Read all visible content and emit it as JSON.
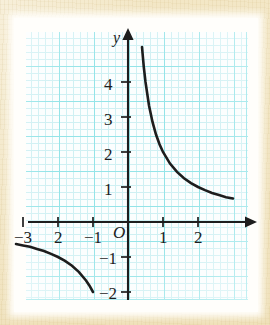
{
  "figure": {
    "kind": "textbook-graph-scan",
    "paper_color": "#f2e6c4",
    "mat_color": "#fffefb",
    "grid_minor_color": "#cdf0f3",
    "grid_major_color": "#8fe3e8",
    "ink_color": "#1d1d1d"
  },
  "axes": {
    "y_axis_label": "y",
    "origin_label": "O",
    "x_tick_labels": [
      "−3",
      "2",
      "−1",
      "1",
      "2"
    ],
    "y_tick_labels": [
      "4",
      "3",
      "2",
      "1",
      "−1",
      "−2"
    ]
  },
  "chart_data": {
    "type": "line",
    "title": "",
    "subtitle": "",
    "xlabel": "",
    "ylabel": "y",
    "xlim": [
      -3.4,
      3.4
    ],
    "ylim": [
      -2.4,
      5.2
    ],
    "grid": true,
    "legend": null,
    "annotations": [],
    "x_ticks": [
      -3,
      -2,
      -1,
      1,
      2
    ],
    "x_tick_text": [
      "−3",
      "2",
      "−1",
      "1",
      "2"
    ],
    "y_ticks": [
      -2,
      -1,
      1,
      2,
      3,
      4
    ],
    "y_tick_text": [
      "−2",
      "−1",
      "1",
      "2",
      "3",
      "4"
    ],
    "origin_text": "O",
    "series": [
      {
        "name": "y = 2/x (right branch)",
        "equation": "y = 2/x",
        "x": [
          0.4,
          0.45,
          0.5,
          0.6,
          0.7,
          0.8,
          0.9,
          1.0,
          1.2,
          1.4,
          1.6,
          1.8,
          2.0,
          2.2,
          2.4,
          2.6,
          2.8,
          3.0
        ],
        "y": [
          5.0,
          4.44,
          4.0,
          3.33,
          2.86,
          2.5,
          2.22,
          2.0,
          1.67,
          1.43,
          1.25,
          1.11,
          1.0,
          0.91,
          0.83,
          0.77,
          0.71,
          0.67
        ]
      },
      {
        "name": "y = 2/x (left branch)",
        "equation": "y = 2/x",
        "x": [
          -3.2,
          -3.0,
          -2.8,
          -2.6,
          -2.4,
          -2.2,
          -2.0,
          -1.8,
          -1.6,
          -1.4,
          -1.2,
          -1.1,
          -1.0
        ],
        "y": [
          -0.63,
          -0.67,
          -0.71,
          -0.77,
          -0.83,
          -0.91,
          -1.0,
          -1.11,
          -1.25,
          -1.43,
          -1.67,
          -1.82,
          -2.0
        ]
      }
    ]
  }
}
